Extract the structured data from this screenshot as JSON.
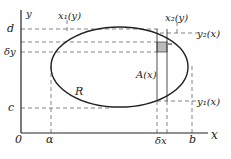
{
  "diagram": {
    "axes": {
      "x_label": "x",
      "y_label": "y",
      "origin_label": "0"
    },
    "x_ticks": [
      {
        "label": "α",
        "x": 51
      },
      {
        "label": "δx",
        "x": 162
      },
      {
        "label": "b",
        "x": 193
      }
    ],
    "y_ticks": [
      {
        "label": "d",
        "y": 29
      },
      {
        "label": "δy",
        "y": 52
      },
      {
        "label": "c",
        "y": 108
      }
    ],
    "curve_labels": {
      "x1": "x₁(y)",
      "x2": "x₂(y)",
      "y1": "y₁(x)",
      "y2": "y₂(x)"
    },
    "region_label": "R",
    "area_label": "A(x)",
    "colors": {
      "ink": "#222222",
      "dash": "#666666",
      "shade": "#bbbbbb"
    }
  }
}
